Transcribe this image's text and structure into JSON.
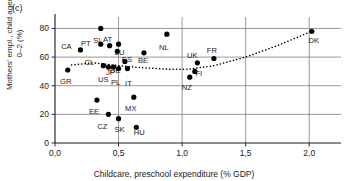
{
  "panel": {
    "label": "(c)"
  },
  "chart_data": {
    "type": "scatter",
    "title": "",
    "panel_label": "(c)",
    "xlabel": "Childcare, preschool expenditure (% GDP)",
    "ylabel": "Mothers' empl., child aged 0–2 (%)",
    "ylabel_line1": "Mothers' empl., child aged",
    "ylabel_line2": "0–2 (%)",
    "xlim": [
      0.0,
      2.25
    ],
    "ylim": [
      0,
      88
    ],
    "xticks": [
      0.0,
      0.5,
      1.0,
      1.5,
      2.0
    ],
    "xticklabels": [
      "0,0",
      "0,5",
      "1,0",
      "1,5",
      "2,0"
    ],
    "yticks": [
      0,
      20,
      40,
      60,
      80
    ],
    "yticklabels": [
      "0",
      "20",
      "40",
      "60",
      "80"
    ],
    "grid": true,
    "grid_axis": "both",
    "legend": "none",
    "marker": "filled-circle",
    "marker_color": "#000000",
    "points": [
      {
        "label": "GR",
        "x": 0.1,
        "y": 51,
        "lx": -2,
        "ly": 14
      },
      {
        "label": "CA",
        "x": 0.2,
        "y": 65,
        "lx": -14,
        "ly": -1
      },
      {
        "label": "EE",
        "x": 0.33,
        "y": 30,
        "lx": -3,
        "ly": 14
      },
      {
        "label": "SI",
        "x": 0.36,
        "y": 80,
        "lx": -4,
        "ly": 15
      },
      {
        "label": "PT",
        "x": 0.36,
        "y": 69,
        "lx": -15,
        "ly": 2
      },
      {
        "label": "CL",
        "x": 0.38,
        "y": 54,
        "lx": -14,
        "ly": -1
      },
      {
        "label": "AT",
        "x": 0.43,
        "y": 68,
        "lx": -2,
        "ly": -4
      },
      {
        "label": "US",
        "x": 0.42,
        "y": 53,
        "lx": -5,
        "ly": 15
      },
      {
        "label": "CZ",
        "x": 0.42,
        "y": 20,
        "lx": -6,
        "ly": 15
      },
      {
        "label": "JP",
        "x": 0.46,
        "y": 53,
        "lx": -3,
        "ly": 8
      },
      {
        "label": "LU",
        "x": 0.5,
        "y": 69,
        "lx": 1,
        "ly": 11
      },
      {
        "label": "DE",
        "x": 0.49,
        "y": 64,
        "lx": -2,
        "ly": 22
      },
      {
        "label": "PL",
        "x": 0.5,
        "y": 52,
        "lx": -3,
        "ly": 16
      },
      {
        "label": "SK",
        "x": 0.5,
        "y": 17,
        "lx": 1,
        "ly": 13
      },
      {
        "label": "ES",
        "x": 0.55,
        "y": 57,
        "lx": 2,
        "ly": 1
      },
      {
        "label": "IT",
        "x": 0.57,
        "y": 52,
        "lx": 1,
        "ly": 17
      },
      {
        "label": "MX",
        "x": 0.62,
        "y": 32,
        "lx": -3,
        "ly": 14
      },
      {
        "label": "HU",
        "x": 0.64,
        "y": 11,
        "lx": 3,
        "ly": 8
      },
      {
        "label": "BE",
        "x": 0.7,
        "y": 63,
        "lx": -1,
        "ly": 10
      },
      {
        "label": "NL",
        "x": 0.88,
        "y": 76,
        "lx": -3,
        "ly": 16
      },
      {
        "label": "NZ",
        "x": 1.06,
        "y": 46,
        "lx": -3,
        "ly": 13
      },
      {
        "label": "FI",
        "x": 1.1,
        "y": 50,
        "lx": 4,
        "ly": 5
      },
      {
        "label": "UK",
        "x": 1.12,
        "y": 56,
        "lx": -5,
        "ly": -5
      },
      {
        "label": "FR",
        "x": 1.25,
        "y": 59,
        "lx": -2,
        "ly": -6
      },
      {
        "label": "DK",
        "x": 2.02,
        "y": 78,
        "lx": 2,
        "ly": 12
      }
    ],
    "trendline": {
      "style": "dotted",
      "color": "#000000",
      "points": [
        {
          "x": 0.13,
          "y": 54.5
        },
        {
          "x": 0.3,
          "y": 56.0
        },
        {
          "x": 0.5,
          "y": 54.0
        },
        {
          "x": 0.7,
          "y": 52.5
        },
        {
          "x": 0.9,
          "y": 51.5
        },
        {
          "x": 1.05,
          "y": 51.5
        },
        {
          "x": 1.25,
          "y": 54.0
        },
        {
          "x": 1.5,
          "y": 60.0
        },
        {
          "x": 1.75,
          "y": 68.0
        },
        {
          "x": 2.02,
          "y": 78.0
        }
      ]
    }
  }
}
